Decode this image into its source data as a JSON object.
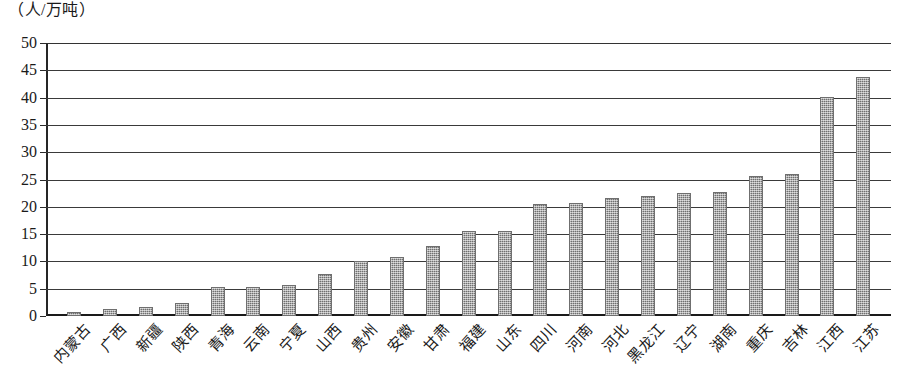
{
  "chart_data": {
    "type": "bar",
    "title": "",
    "subtitle": "",
    "xlabel": "",
    "ylabel": "（人/万吨）",
    "ylim": [
      0,
      50
    ],
    "y_ticks": [
      0,
      5,
      10,
      15,
      20,
      25,
      30,
      35,
      40,
      45,
      50
    ],
    "grid": true,
    "legend": null,
    "orientation": "vertical",
    "bar_color": "#8e8e8e",
    "categories": [
      "内蒙古",
      "广西",
      "新疆",
      "陕西",
      "青海",
      "云南",
      "宁夏",
      "山西",
      "贵州",
      "安徽",
      "甘肃",
      "福建",
      "山东",
      "四川",
      "河南",
      "河北",
      "黑龙江",
      "辽宁",
      "湖南",
      "重庆",
      "吉林",
      "江西",
      "江苏"
    ],
    "values": [
      0.8,
      1.3,
      1.7,
      2.3,
      5.3,
      5.4,
      5.7,
      7.7,
      10.1,
      10.8,
      12.9,
      15.6,
      15.6,
      20.5,
      20.7,
      21.6,
      22.0,
      22.6,
      22.7,
      25.6,
      26.0,
      40.1,
      43.7
    ]
  }
}
